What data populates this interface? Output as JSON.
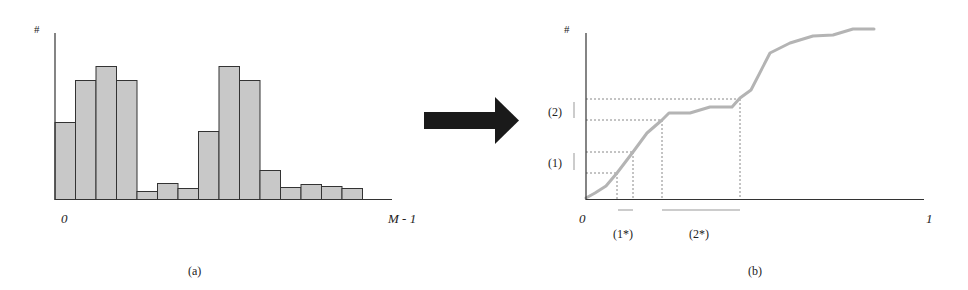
{
  "chart_data": [
    {
      "type": "bar",
      "panel": "a",
      "title": "(a)",
      "xlabel_start": "0",
      "xlabel_end": "M - 1",
      "ylabel": "#",
      "description": "Image histogram with two modes",
      "categories": [
        1,
        2,
        3,
        4,
        5,
        6,
        7,
        8,
        9,
        10,
        11,
        12,
        13,
        14,
        15
      ],
      "values": [
        77,
        119,
        133,
        119,
        8,
        16,
        11,
        68,
        133,
        119,
        29,
        12,
        15,
        13,
        11
      ],
      "grid": false
    },
    {
      "type": "line",
      "panel": "b",
      "title": "(b)",
      "xlabel_start": "0",
      "xlabel_end": "1",
      "ylabel": "#",
      "description": "Cumulative histogram (CDF) with interval mapping",
      "points": [
        [
          586,
          198
        ],
        [
          595,
          193
        ],
        [
          606,
          186
        ],
        [
          617,
          173
        ],
        [
          633,
          152
        ],
        [
          647,
          133
        ],
        [
          662,
          120
        ],
        [
          669,
          113
        ],
        [
          690,
          113
        ],
        [
          710,
          107
        ],
        [
          732,
          107
        ],
        [
          740,
          98
        ],
        [
          751,
          90
        ],
        [
          770,
          53
        ],
        [
          790,
          43
        ],
        [
          813,
          36
        ],
        [
          833,
          35
        ],
        [
          853,
          29
        ],
        [
          874,
          29
        ]
      ],
      "annotations": {
        "y_intervals": [
          {
            "label": "(1)",
            "y_from": 173,
            "y_to": 152
          },
          {
            "label": "(2)",
            "y_from": 120,
            "y_to": 99
          }
        ],
        "x_intervals": [
          {
            "label": "(1*)",
            "x_from": 617,
            "x_to": 633
          },
          {
            "label": "(2*)",
            "x_from": 662,
            "x_to": 740
          }
        ]
      },
      "grid": false
    }
  ],
  "labels": {
    "a_caption": "(a)",
    "b_caption": "(b)",
    "a_y": "#",
    "b_y": "#",
    "a_x0": "0",
    "a_xend": "M - 1",
    "b_x0": "0",
    "b_xend": "1",
    "y1": "(1)",
    "y2": "(2)",
    "x1": "(1*)",
    "x2": "(2*)"
  },
  "colors": {
    "bar_fill": "#c8c8c8",
    "bar_stroke": "#333333",
    "axis": "#333333",
    "curve": "#b4b4b4",
    "dotted": "#888888",
    "arrow": "#1a1a1a"
  }
}
